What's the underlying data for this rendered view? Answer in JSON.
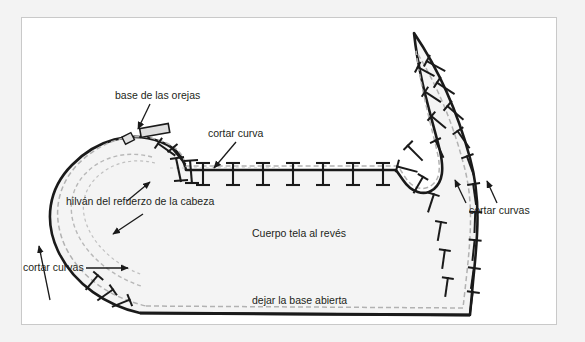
{
  "document": {
    "title": "Patrón de costura - cuerpo",
    "background_color": "#f3f3f3",
    "page_color": "#ffffff",
    "border_color": "#c9c9c9"
  },
  "colors": {
    "outline": "#1a1a1a",
    "seam_dashed": "#b0b0b0",
    "fill": "#f4f4f4",
    "text": "#231f20",
    "notch": "#1a1a1a",
    "ear_tab_fill": "#d8d8d8"
  },
  "labels": {
    "ears": "base de las orejas",
    "cortar_curva": "cortar curva",
    "hilvan": "hilván del refuerzo de la cabeza",
    "cortar_curvas_left": "cortar curvas",
    "cortar_curvas_right": "cortar curvas",
    "cuerpo": "Cuerpo tela al revés",
    "base_abierta": "dejar la base abierta"
  },
  "pattern": {
    "type": "sewing-pattern",
    "description": "Pieza de patrón en forma de cuerpo con cabeza redondeada a la izquierda y cola puntiaguda a la derecha",
    "outline_path": "M 140 313 L 470 315 L 473 282 C 478 235 480 200 470 160 C 458 112 440 70 414 33 C 418 78 432 120 440 150 C 444 168 443 180 434 188 C 424 196 412 192 404 180 L 396 170 L 185 170 C 182 156 175 148 160 142 C 130 130 96 140 72 164 C 48 188 44 220 58 250 C 74 284 108 306 140 313 Z",
    "seam_path": "M 146 306 L 463 308 L 466 282 C 471 236 473 201 463 163 C 452 118 436 82 416 50 C 420 88 431 124 437 150 C 441 167 440 178 432 184 C 423 191 413 188 406 177 L 398 166 L 186 166 C 183 153 176 146 161 141 C 133 130 101 140 78 163 C 56 186 52 216 65 245 C 80 277 112 298 146 306",
    "head_inner_path": "M 150 160 C 124 152 100 158 84 175 C 68 192 66 215 78 238 C 90 260 113 277 140 286",
    "ear_tabs": [
      {
        "x": 128,
        "y": 139,
        "w": 9,
        "h": 8,
        "rot": -28
      },
      {
        "x": 140,
        "y": 134,
        "w": 30,
        "h": 9,
        "rot": -12
      }
    ],
    "notch_count_top": 13,
    "notch_count_tail": 22,
    "notch_count_head": 7
  },
  "annotations": [
    {
      "name": "arrow-ears",
      "from": [
        148,
        103
      ],
      "to": [
        137,
        130
      ]
    },
    {
      "name": "arrow-cortar-curva",
      "from": [
        233,
        141
      ],
      "to": [
        212,
        169
      ]
    },
    {
      "name": "arrow-hilvan-up",
      "from": [
        126,
        200
      ],
      "to": [
        150,
        181
      ]
    },
    {
      "name": "arrow-hilvan-down",
      "from": [
        142,
        215
      ],
      "to": [
        112,
        235
      ]
    },
    {
      "name": "arrow-cortar-curvas-left",
      "from": [
        48,
        300
      ],
      "to": [
        38,
        245
      ]
    },
    {
      "name": "arrow-cortar-curvas-right-a",
      "from": [
        467,
        202
      ],
      "to": [
        455,
        178
      ]
    },
    {
      "name": "arrow-cortar-curvas-right-b",
      "from": [
        494,
        202
      ],
      "to": [
        486,
        180
      ]
    }
  ]
}
